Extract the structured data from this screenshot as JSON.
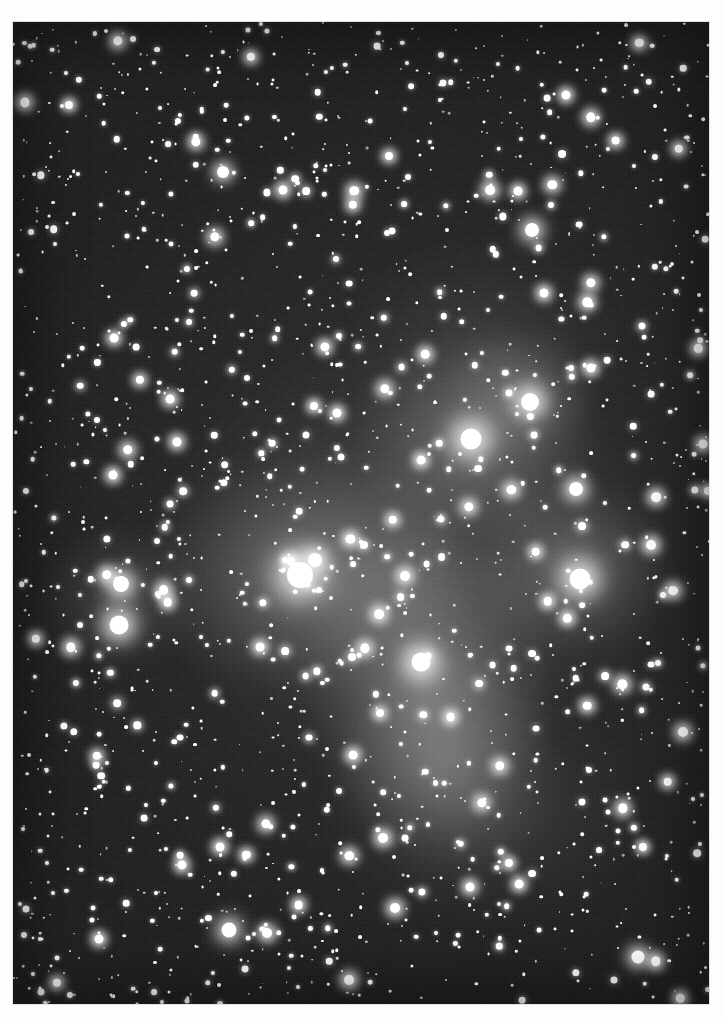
{
  "image": {
    "kind": "astrophotograph",
    "subject": "Pleiades open star cluster (M45) with reflection nebulosity",
    "rendering": "monochrome / black-and-white halftone print",
    "orientation": "portrait",
    "caption": "",
    "print": {
      "paper_color": "#fdfdfd",
      "photo_left": 13,
      "photo_top": 22,
      "photo_width": 696,
      "photo_height": 982
    },
    "palette": {
      "sky_dark": "#1a1a1a",
      "sky_mid": "#272727",
      "sky_light": "#343434",
      "star_core": "#ffffff",
      "nebula_glow": "#b9b9b9"
    }
  },
  "chart_data": {
    "type": "scatter",
    "title": "",
    "xlabel": "",
    "ylabel": "",
    "xlim": [
      0,
      696
    ],
    "ylim": [
      0,
      982
    ],
    "grid": false,
    "legend": null,
    "nebulae": [
      {
        "name": "alcyone-nebulosity",
        "x": 295,
        "y": 552,
        "rx": 150,
        "ry": 118,
        "intensity": 0.4
      },
      {
        "name": "maia-nebulosity",
        "x": 463,
        "y": 415,
        "rx": 118,
        "ry": 100,
        "intensity": 0.38
      },
      {
        "name": "merope-nebulosity",
        "x": 415,
        "y": 660,
        "rx": 120,
        "ry": 150,
        "intensity": 0.42
      },
      {
        "name": "merope-tail",
        "x": 432,
        "y": 740,
        "rx": 105,
        "ry": 110,
        "intensity": 0.3
      },
      {
        "name": "electra-nebulosity",
        "x": 560,
        "y": 545,
        "rx": 95,
        "ry": 85,
        "intensity": 0.34
      },
      {
        "name": "atlas-nebulosity",
        "x": 510,
        "y": 368,
        "rx": 72,
        "ry": 62,
        "intensity": 0.26
      },
      {
        "name": "central-haze",
        "x": 400,
        "y": 540,
        "rx": 230,
        "ry": 210,
        "intensity": 0.16
      },
      {
        "name": "taygeta-haze",
        "x": 108,
        "y": 575,
        "rx": 78,
        "ry": 70,
        "intensity": 0.2
      },
      {
        "name": "lower-sweep",
        "x": 470,
        "y": 790,
        "rx": 150,
        "ry": 105,
        "intensity": 0.14
      },
      {
        "name": "upper-sweep",
        "x": 470,
        "y": 320,
        "rx": 130,
        "ry": 95,
        "intensity": 0.11
      }
    ],
    "bright_stars": [
      {
        "name": "alcyone",
        "x": 287,
        "y": 553,
        "r": 13.0,
        "halo": 62
      },
      {
        "name": "maia",
        "x": 458,
        "y": 417,
        "r": 10.5,
        "halo": 52
      },
      {
        "name": "electra",
        "x": 567,
        "y": 557,
        "r": 10.5,
        "halo": 50
      },
      {
        "name": "merope",
        "x": 408,
        "y": 640,
        "r": 9.5,
        "halo": 48
      },
      {
        "name": "taygeta",
        "x": 106,
        "y": 603,
        "r": 9.5,
        "halo": 38
      },
      {
        "name": "pleione",
        "x": 108,
        "y": 562,
        "r": 8.0,
        "halo": 30
      },
      {
        "name": "atlas",
        "x": 517,
        "y": 380,
        "r": 9.0,
        "halo": 36
      },
      {
        "name": "asterope",
        "x": 302,
        "y": 538,
        "r": 7.0,
        "halo": 24
      },
      {
        "name": "celaeno",
        "x": 563,
        "y": 467,
        "r": 7.0,
        "halo": 22
      },
      {
        "name": "star-upper-right",
        "x": 519,
        "y": 208,
        "r": 7.0,
        "halo": 20
      },
      {
        "name": "star-lower-mid",
        "x": 216,
        "y": 908,
        "r": 7.5,
        "halo": 22
      },
      {
        "name": "star-right-low",
        "x": 625,
        "y": 935,
        "r": 6.5,
        "halo": 18
      },
      {
        "name": "star-top-mid",
        "x": 210,
        "y": 150,
        "r": 6.0,
        "halo": 16
      }
    ]
  }
}
